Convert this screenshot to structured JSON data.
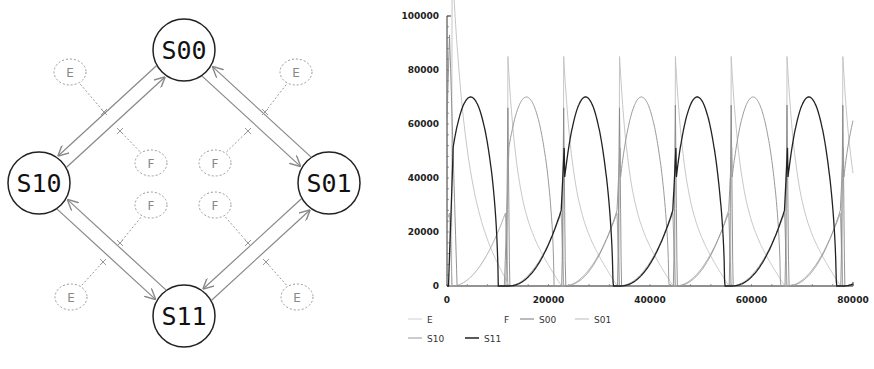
{
  "diagram": {
    "nodes": [
      {
        "id": "S00",
        "label": "S00",
        "cx": 184,
        "cy": 50
      },
      {
        "id": "S01",
        "label": "S01",
        "cx": 329,
        "cy": 183
      },
      {
        "id": "S10",
        "label": "S10",
        "cx": 39,
        "cy": 183
      },
      {
        "id": "S11",
        "label": "S11",
        "cx": 184,
        "cy": 316
      }
    ],
    "modifiers": [
      {
        "label": "E",
        "x": 70,
        "y": 72
      },
      {
        "label": "E",
        "x": 296,
        "y": 72
      },
      {
        "label": "F",
        "x": 151,
        "y": 163
      },
      {
        "label": "F",
        "x": 215,
        "y": 163
      },
      {
        "label": "F",
        "x": 151,
        "y": 205
      },
      {
        "label": "F",
        "x": 215,
        "y": 205
      },
      {
        "label": "E",
        "x": 71,
        "y": 297
      },
      {
        "label": "E",
        "x": 297,
        "y": 297
      }
    ],
    "edges": [
      {
        "from": "S00",
        "to": "S10",
        "modifier": "E"
      },
      {
        "from": "S10",
        "to": "S00",
        "modifier": "F"
      },
      {
        "from": "S00",
        "to": "S01",
        "modifier": "E"
      },
      {
        "from": "S01",
        "to": "S00",
        "modifier": "F"
      },
      {
        "from": "S10",
        "to": "S11",
        "modifier": "E"
      },
      {
        "from": "S11",
        "to": "S10",
        "modifier": "F"
      },
      {
        "from": "S11",
        "to": "S01",
        "modifier": "F"
      },
      {
        "from": "S01",
        "to": "S11",
        "modifier": "E"
      }
    ]
  },
  "chart_data": {
    "type": "line",
    "title": "",
    "xlabel": "",
    "ylabel": "",
    "xlim": [
      0,
      80000
    ],
    "ylim": [
      0,
      100000
    ],
    "x_ticks": [
      "0",
      "20000",
      "40000",
      "60000",
      "80000"
    ],
    "y_ticks": [
      "0",
      "20000",
      "40000",
      "60000",
      "80000",
      "100000"
    ],
    "grid": false,
    "legend_position": "bottom",
    "legend": [
      "E",
      "F",
      "S00",
      "S01",
      "S10",
      "S11"
    ],
    "series": [
      {
        "name": "E",
        "color": "#c8c8c8",
        "description": "near zero, flat"
      },
      {
        "name": "F",
        "color": "#ffffff",
        "description": "not visible"
      },
      {
        "name": "S00",
        "color": "#777777",
        "description": "sharp spikes ~67000 at ~12000, ~23000, ~34000, ~45000, ~56000, ~67000, ~78000; initial spike ~93000 at ~500"
      },
      {
        "name": "S01",
        "color": "#aaaaaa",
        "description": "peaks ~70000 at ~16000, ~38000, ~60000; decays through ~30000"
      },
      {
        "name": "S10",
        "color": "#999999",
        "description": "rises from 0 to ~28000 before each peak"
      },
      {
        "name": "S11",
        "color": "#222222",
        "description": "peaks ~70000 at ~5000, ~27000, ~49000, ~71000; drops to 0 at ~12000, ~34000, ~56000, ~78000"
      }
    ],
    "peaks": {
      "S11": [
        [
          5000,
          70000
        ],
        [
          27000,
          70000
        ],
        [
          49000,
          70000
        ],
        [
          71000,
          70000
        ]
      ],
      "S01": [
        [
          16000,
          70000
        ],
        [
          38000,
          70000
        ],
        [
          60000,
          70000
        ]
      ],
      "S00_spikes": [
        [
          500,
          93000
        ],
        [
          12000,
          66000
        ],
        [
          23000,
          66000
        ],
        [
          34000,
          66000
        ],
        [
          45000,
          67000
        ],
        [
          56000,
          67000
        ],
        [
          67000,
          67000
        ],
        [
          78000,
          67000
        ]
      ]
    }
  }
}
